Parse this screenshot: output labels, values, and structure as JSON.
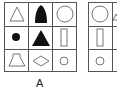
{
  "panels": [
    {
      "label": "A",
      "cells": [
        [
          "triangle-outline",
          "bullet-filled",
          "circle-outline"
        ],
        [
          "dot-filled",
          "triangle-filled",
          "rectangle-outline"
        ],
        [
          "trapezoid-outline",
          "diamond-outline",
          "small-circle-outline"
        ]
      ]
    },
    {
      "label": "",
      "cells": [
        [
          "circle-outline"
        ],
        [
          "rectangle-outline"
        ],
        [
          "small-circle-outline"
        ]
      ]
    }
  ],
  "colors": {
    "line": "#555555",
    "fill": "#111111",
    "stroke": "#777777"
  }
}
